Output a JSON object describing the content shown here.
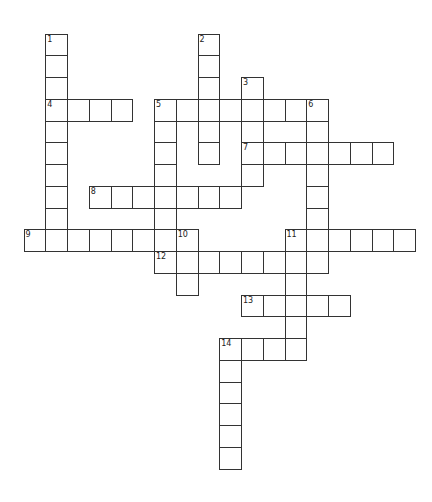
{
  "puzzle": {
    "type": "crossword",
    "grid_origin": {
      "x": 24,
      "y": 34
    },
    "cell_size": 21.75,
    "line_color": "#333333",
    "cell_color": "#ffffff",
    "entries": [
      {
        "number": "1",
        "direction": "down",
        "row": 0,
        "col": 1,
        "length": 10
      },
      {
        "number": "2",
        "direction": "down",
        "row": 0,
        "col": 8,
        "length": 6
      },
      {
        "number": "3",
        "direction": "down",
        "row": 2,
        "col": 10,
        "length": 5
      },
      {
        "number": "4",
        "direction": "across",
        "row": 3,
        "col": 1,
        "length": 4
      },
      {
        "number": "5",
        "direction": "across",
        "row": 3,
        "col": 6,
        "length": 8
      },
      {
        "number": "5",
        "direction": "down",
        "row": 3,
        "col": 6,
        "length": 8
      },
      {
        "number": "6",
        "direction": "down",
        "row": 3,
        "col": 13,
        "length": 8
      },
      {
        "number": "7",
        "direction": "across",
        "row": 5,
        "col": 10,
        "length": 7
      },
      {
        "number": "8",
        "direction": "across",
        "row": 7,
        "col": 3,
        "length": 7
      },
      {
        "number": "9",
        "direction": "across",
        "row": 9,
        "col": 0,
        "length": 8
      },
      {
        "number": "10",
        "direction": "down",
        "row": 9,
        "col": 7,
        "length": 3
      },
      {
        "number": "11",
        "direction": "across",
        "row": 9,
        "col": 12,
        "length": 6
      },
      {
        "number": "11",
        "direction": "down",
        "row": 9,
        "col": 12,
        "length": 6
      },
      {
        "number": "12",
        "direction": "across",
        "row": 10,
        "col": 6,
        "length": 8
      },
      {
        "number": "13",
        "direction": "across",
        "row": 12,
        "col": 10,
        "length": 5
      },
      {
        "number": "14",
        "direction": "across",
        "row": 14,
        "col": 9,
        "length": 4
      },
      {
        "number": "14",
        "direction": "down",
        "row": 14,
        "col": 9,
        "length": 6
      }
    ]
  }
}
